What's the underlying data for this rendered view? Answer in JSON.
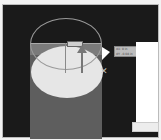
{
  "canvas": {
    "background": "#1a1a1a",
    "shapes": {
      "cylinder_fill": "#5e5e5e",
      "ellipse_fill": "#e6e6e6",
      "arc_stroke": "#9a9a9a"
    }
  },
  "tooltip": {
    "line1": "dX: 0 in",
    "line2": "dY: -0.08 in"
  },
  "cursor": {
    "type": "arrow-pointer",
    "modifier": "x-mark"
  }
}
